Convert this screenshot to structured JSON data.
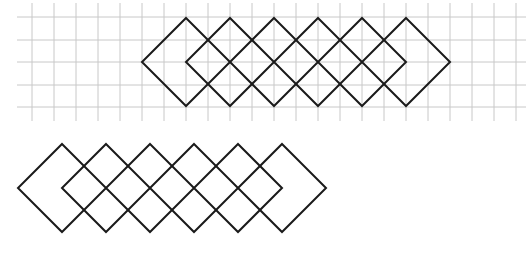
{
  "figure": {
    "colors": {
      "background": "#ffffff",
      "grid": "#c8c8c8",
      "stroke": "#1a1a1a"
    },
    "grid": {
      "x_lines": [
        32,
        54,
        76,
        98,
        120,
        142,
        164,
        186,
        208,
        230,
        252,
        274,
        296,
        318,
        340,
        362,
        384,
        406,
        428,
        450,
        472,
        494,
        516
      ],
      "y_lines": [
        17,
        40,
        62,
        85,
        107
      ],
      "x_start": 17,
      "x_end": 526,
      "y_start": 3,
      "y_end": 121
    },
    "top_pattern": {
      "label": "pattern-on-grid",
      "center_y": 62,
      "half_size": 44,
      "centers_x": [
        186,
        230,
        274,
        318,
        362,
        406
      ]
    },
    "bottom_pattern": {
      "label": "pattern-without-grid",
      "center_y": 188,
      "half_size": 44,
      "centers_x": [
        62,
        106,
        150,
        194,
        238,
        282
      ]
    }
  }
}
